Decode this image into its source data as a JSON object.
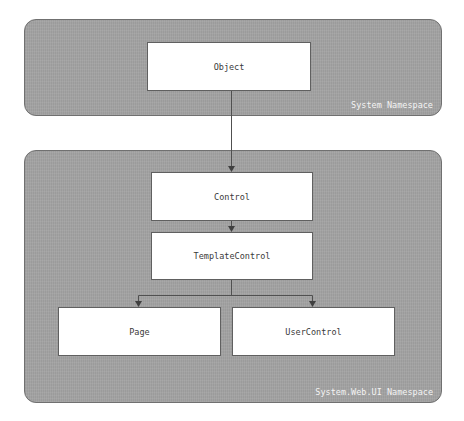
{
  "diagram": {
    "panels": [
      {
        "id": "system",
        "label": "System Namespace"
      },
      {
        "id": "system-web-ui",
        "label": "System.Web.UI Namespace"
      }
    ],
    "nodes": {
      "object": "Object",
      "control": "Control",
      "template_control": "TemplateControl",
      "page": "Page",
      "user_control": "UserControl"
    },
    "edges": [
      {
        "from": "Object",
        "to": "Control"
      },
      {
        "from": "Control",
        "to": "TemplateControl"
      },
      {
        "from": "TemplateControl",
        "to": "Page"
      },
      {
        "from": "TemplateControl",
        "to": "UserControl"
      }
    ],
    "colors": {
      "panel_fill": "#a3a3a3",
      "panel_border": "#707070",
      "box_fill": "#ffffff",
      "line": "#505050",
      "panel_label": "#f4f4f4"
    }
  }
}
